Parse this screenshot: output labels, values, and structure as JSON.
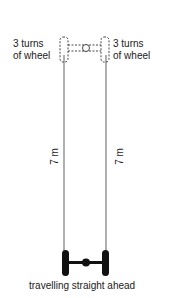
{
  "labels": {
    "left_top_line1": "3 turns",
    "left_top_line2": "of wheel",
    "right_top_line1": "3 turns",
    "right_top_line2": "of wheel",
    "left_distance": "7 m",
    "right_distance": "7 m",
    "caption": "travelling straight ahead"
  },
  "colors": {
    "ink": "#1a1a1a",
    "background": "#ffffff"
  }
}
